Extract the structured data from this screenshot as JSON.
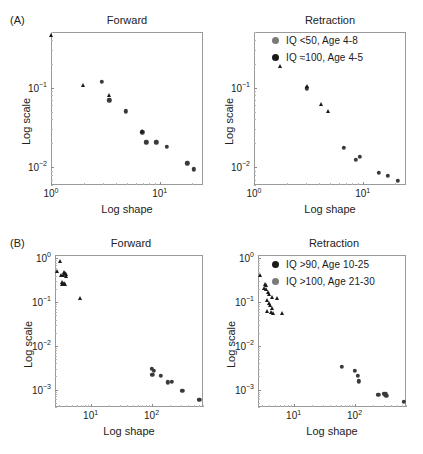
{
  "figure": {
    "background": "#ffffff",
    "marker_black": "#1a1a1a",
    "marker_gray": "#7a7a7a",
    "axis_color": "#9a9a9a"
  },
  "panels": [
    {
      "id": "A-forward",
      "panel_label": "(A)",
      "title": "Forward",
      "xlabel": "Log shape",
      "ylabel": "Log scale",
      "legend": []
    },
    {
      "id": "A-retraction",
      "panel_label": "",
      "title": "Retraction",
      "xlabel": "Log shape",
      "ylabel": "Log scale",
      "legend": [
        {
          "marker": "gray-circle",
          "color": "#7a7a7a",
          "label": "IQ <50,   Age 4-8"
        },
        {
          "marker": "black-circle",
          "color": "#1a1a1a",
          "label": "IQ ≈100, Age 4-5"
        }
      ]
    },
    {
      "id": "B-forward",
      "panel_label": "(B)",
      "title": "Forward",
      "xlabel": "Log shape",
      "ylabel": "Log scale",
      "legend": []
    },
    {
      "id": "B-retraction",
      "panel_label": "",
      "title": "Retraction",
      "xlabel": "Log shape",
      "ylabel": "Log scale",
      "legend": [
        {
          "marker": "black-circle",
          "color": "#1a1a1a",
          "label": "IQ >90,   Age 10-25"
        },
        {
          "marker": "gray-circle",
          "color": "#7a7a7a",
          "label": "IQ >100, Age 21-30"
        }
      ]
    }
  ],
  "chart_data": [
    {
      "id": "A-forward",
      "type": "scatter",
      "title": "Forward",
      "panel_label": "(A)",
      "xlabel": "Log shape",
      "ylabel": "Log scale",
      "xscale": "log",
      "yscale": "log",
      "xlim": [
        1,
        25
      ],
      "ylim": [
        0.006,
        0.5
      ],
      "xticks": [
        1,
        10
      ],
      "xticklabels": [
        "10^0",
        "10^1"
      ],
      "yticks": [
        0.01,
        0.1
      ],
      "yticklabels": [
        "10^-2",
        "10^-1"
      ],
      "grid": false,
      "series": [
        {
          "name": "IQ <50, Age 4-8",
          "marker": "circle",
          "color": "#3a3a3a",
          "points": [
            {
              "x": 2.95,
              "y": 0.118
            },
            {
              "x": 3.45,
              "y": 0.0695
            },
            {
              "x": 4.85,
              "y": 0.0505
            },
            {
              "x": 6.9,
              "y": 0.0275
            },
            {
              "x": 7.5,
              "y": 0.0205
            },
            {
              "x": 9.3,
              "y": 0.0205
            },
            {
              "x": 11.6,
              "y": 0.018
            },
            {
              "x": 18.0,
              "y": 0.0112
            },
            {
              "x": 20.5,
              "y": 0.0094
            }
          ]
        },
        {
          "name": "IQ ≈100, Age 4-5",
          "marker": "triangle",
          "color": "#1a1a1a",
          "points": [
            {
              "x": 1.0,
              "y": 0.46
            },
            {
              "x": 1.95,
              "y": 0.108
            },
            {
              "x": 3.4,
              "y": 0.081
            },
            {
              "x": 6.85,
              "y": 0.0285
            }
          ]
        }
      ]
    },
    {
      "id": "A-retraction",
      "type": "scatter",
      "title": "Retraction",
      "panel_label": "",
      "xlabel": "Log shape",
      "ylabel": "Log scale",
      "xscale": "log",
      "yscale": "log",
      "xlim": [
        1,
        25
      ],
      "ylim": [
        0.006,
        0.5
      ],
      "xticks": [
        1,
        10
      ],
      "xticklabels": [
        "10^0",
        "10^1"
      ],
      "yticks": [
        0.01,
        0.1
      ],
      "yticklabels": [
        "10^-2",
        "10^-1"
      ],
      "grid": false,
      "series": [
        {
          "name": "IQ <50, Age 4-8",
          "marker": "circle",
          "color": "#3a3a3a",
          "points": [
            {
              "x": 3.05,
              "y": 0.098
            },
            {
              "x": 6.7,
              "y": 0.0175
            },
            {
              "x": 8.6,
              "y": 0.0125
            },
            {
              "x": 9.4,
              "y": 0.0135
            },
            {
              "x": 14.0,
              "y": 0.0085
            },
            {
              "x": 17.0,
              "y": 0.0078
            },
            {
              "x": 21.0,
              "y": 0.0068
            }
          ]
        },
        {
          "name": "IQ ≈100, Age 4-5",
          "marker": "triangle",
          "color": "#1a1a1a",
          "points": [
            {
              "x": 1.72,
              "y": 0.185
            },
            {
              "x": 3.05,
              "y": 0.104
            },
            {
              "x": 4.1,
              "y": 0.062
            },
            {
              "x": 4.75,
              "y": 0.0515
            }
          ]
        }
      ]
    },
    {
      "id": "B-forward",
      "type": "scatter",
      "title": "Forward",
      "panel_label": "(B)",
      "xlabel": "Log shape",
      "ylabel": "Log scale",
      "xscale": "log",
      "yscale": "log",
      "xlim": [
        2.6,
        700
      ],
      "ylim": [
        0.0004,
        1.2
      ],
      "xticks": [
        10,
        100
      ],
      "xticklabels": [
        "10^1",
        "10^2"
      ],
      "yticks": [
        0.001,
        0.01,
        0.1,
        1
      ],
      "yticklabels": [
        "10^-3",
        "10^-2",
        "10^-1",
        "10^0"
      ],
      "grid": false,
      "series": [
        {
          "name": "IQ >90, Age 10-25",
          "marker": "triangle",
          "color": "#1a1a1a",
          "points": [
            {
              "x": 3.15,
              "y": 0.86
            },
            {
              "x": 2.78,
              "y": 0.52
            },
            {
              "x": 3.6,
              "y": 0.5
            },
            {
              "x": 3.75,
              "y": 0.47
            },
            {
              "x": 3.9,
              "y": 0.44
            },
            {
              "x": 3.5,
              "y": 0.42
            },
            {
              "x": 3.3,
              "y": 0.41
            },
            {
              "x": 3.95,
              "y": 0.4
            },
            {
              "x": 3.45,
              "y": 0.285
            },
            {
              "x": 3.62,
              "y": 0.275
            },
            {
              "x": 3.8,
              "y": 0.265
            },
            {
              "x": 3.35,
              "y": 0.255
            },
            {
              "x": 6.6,
              "y": 0.125
            }
          ]
        },
        {
          "name": "IQ >100, Age 21-30",
          "marker": "circle",
          "color": "#3a3a3a",
          "points": [
            {
              "x": 100,
              "y": 0.003
            },
            {
              "x": 108,
              "y": 0.0027
            },
            {
              "x": 103,
              "y": 0.0022
            },
            {
              "x": 142,
              "y": 0.0021
            },
            {
              "x": 185,
              "y": 0.00148
            },
            {
              "x": 215,
              "y": 0.00152
            },
            {
              "x": 320,
              "y": 0.00095
            },
            {
              "x": 610,
              "y": 0.00058
            }
          ]
        }
      ]
    },
    {
      "id": "B-retraction",
      "type": "scatter",
      "title": "Retraction",
      "panel_label": "",
      "xlabel": "Log shape",
      "ylabel": "Log scale",
      "xscale": "log",
      "yscale": "log",
      "xlim": [
        2.6,
        700
      ],
      "ylim": [
        0.0004,
        1.2
      ],
      "xticks": [
        10,
        100
      ],
      "xticklabels": [
        "10^1",
        "10^2"
      ],
      "yticks": [
        0.001,
        0.01,
        0.1,
        1
      ],
      "yticklabels": [
        "10^-3",
        "10^-2",
        "10^-1",
        "10^0"
      ],
      "grid": false,
      "series": [
        {
          "name": "IQ >90, Age 10-25",
          "marker": "triangle",
          "color": "#1a1a1a",
          "points": [
            {
              "x": 2.78,
              "y": 0.42
            },
            {
              "x": 3.35,
              "y": 0.255
            },
            {
              "x": 3.5,
              "y": 0.245
            },
            {
              "x": 3.3,
              "y": 0.215
            },
            {
              "x": 3.55,
              "y": 0.195
            },
            {
              "x": 3.75,
              "y": 0.175
            },
            {
              "x": 3.95,
              "y": 0.155
            },
            {
              "x": 4.35,
              "y": 0.128
            },
            {
              "x": 3.62,
              "y": 0.115
            },
            {
              "x": 5.3,
              "y": 0.122
            },
            {
              "x": 3.9,
              "y": 0.098
            },
            {
              "x": 4.15,
              "y": 0.088
            },
            {
              "x": 4.4,
              "y": 0.072
            },
            {
              "x": 3.7,
              "y": 0.062
            },
            {
              "x": 4.2,
              "y": 0.06
            },
            {
              "x": 4.6,
              "y": 0.058
            },
            {
              "x": 6.4,
              "y": 0.058
            }
          ]
        },
        {
          "name": "IQ >100, Age 21-30",
          "marker": "circle",
          "color": "#3a3a3a",
          "points": [
            {
              "x": 62,
              "y": 0.0033
            },
            {
              "x": 100,
              "y": 0.0027
            },
            {
              "x": 112,
              "y": 0.0021
            },
            {
              "x": 118,
              "y": 0.00155
            },
            {
              "x": 245,
              "y": 0.00075
            },
            {
              "x": 300,
              "y": 0.0008
            },
            {
              "x": 318,
              "y": 0.00078
            },
            {
              "x": 330,
              "y": 0.00072
            },
            {
              "x": 640,
              "y": 0.00052
            }
          ]
        }
      ]
    }
  ]
}
